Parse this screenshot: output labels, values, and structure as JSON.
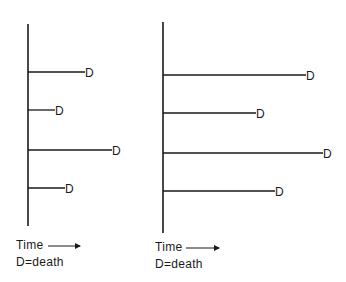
{
  "panels": [
    {
      "id": "left",
      "axis": {
        "x": 28,
        "y_top": 24,
        "y_bottom": 226
      },
      "lines": [
        {
          "y": 72,
          "x_end": 85,
          "label": "D"
        },
        {
          "y": 110,
          "x_end": 55,
          "label": "D"
        },
        {
          "y": 150,
          "x_end": 112,
          "label": "D"
        },
        {
          "y": 188,
          "x_end": 65,
          "label": "D"
        }
      ],
      "time_label": "Time",
      "legend": "D=death",
      "label_x": 16,
      "arrow": {
        "x1": 48,
        "x2": 80,
        "y": 246
      }
    },
    {
      "id": "right",
      "axis": {
        "x": 163,
        "y_top": 22,
        "y_bottom": 233
      },
      "lines": [
        {
          "y": 75,
          "x_end": 306,
          "label": "D"
        },
        {
          "y": 113,
          "x_end": 256,
          "label": "D"
        },
        {
          "y": 153,
          "x_end": 323,
          "label": "D"
        },
        {
          "y": 191,
          "x_end": 275,
          "label": "D"
        }
      ],
      "time_label": "Time",
      "legend": "D=death",
      "label_x": 155,
      "arrow": {
        "x1": 186,
        "x2": 219,
        "y": 248
      }
    }
  ],
  "colors": {
    "stroke": "#1a1a1a",
    "background": "#ffffff"
  }
}
